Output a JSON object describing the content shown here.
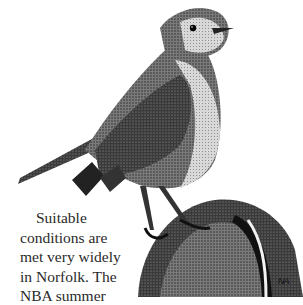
{
  "illustration": {
    "subject": "robin perched on post",
    "style": "pen-and-ink stipple"
  },
  "text": {
    "lines": [
      "Suitable",
      "conditions are",
      "met very widely",
      "in Norfolk. The",
      "NBA summer"
    ]
  },
  "signature": "NA"
}
